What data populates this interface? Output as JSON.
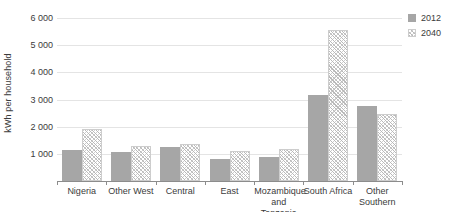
{
  "chart_data": {
    "type": "bar",
    "title": "",
    "xlabel": "",
    "ylabel": "kWh per household",
    "ylim": [
      0,
      6000
    ],
    "yticks": [
      0,
      1000,
      2000,
      3000,
      4000,
      5000,
      6000
    ],
    "ytick_labels": [
      "",
      "1 000",
      "2 000",
      "3 000",
      "4 000",
      "5 000",
      "6 000"
    ],
    "grid": true,
    "legend_position": "top-right",
    "categories": [
      "Nigeria",
      "Other West",
      "Central",
      "East",
      "Mozambique and Tanzania",
      "South Africa",
      "Other Southern"
    ],
    "series": [
      {
        "name": "2012",
        "style": "solid",
        "color": "#a6a6a6",
        "values": [
          1150,
          1050,
          1250,
          800,
          880,
          3150,
          2750
        ]
      },
      {
        "name": "2040",
        "style": "diagonal-hatch",
        "color": "#b9b9b9",
        "values": [
          1900,
          1300,
          1350,
          1100,
          1180,
          5550,
          2450
        ]
      }
    ]
  },
  "legend": {
    "entries": [
      {
        "label": "2012"
      },
      {
        "label": "2040"
      }
    ]
  }
}
